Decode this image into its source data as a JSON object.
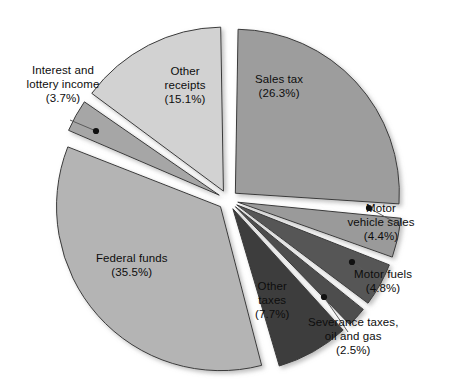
{
  "chart_data": {
    "type": "pie",
    "title": "",
    "subtitle": "",
    "xlabel": "",
    "ylabel": "",
    "legend_position": "none",
    "grid": false,
    "exploded": true,
    "value_unit": "percent",
    "categories": [
      "Sales tax",
      "Motor vehicle sales",
      "Motor fuels",
      "Severance taxes, oil and gas",
      "Other taxes",
      "Federal funds",
      "Interest and lottery income",
      "Other receipts"
    ],
    "values": [
      26.3,
      4.4,
      4.8,
      2.5,
      7.7,
      35.5,
      3.7,
      15.1
    ],
    "slices": [
      {
        "name": "sales-tax",
        "label": "Sales tax",
        "value": 26.3,
        "value_text": "(26.3%)",
        "color": "#9d9d9d",
        "label_placement": "inside",
        "label_x": 279,
        "label_y": 86,
        "label_text": "Sales tax\n(26.3%)"
      },
      {
        "name": "motor-vehicle-sales",
        "label": "Motor vehicle sales",
        "value": 4.4,
        "value_text": "(4.4%)",
        "color": "#9a9a9a",
        "label_placement": "outside",
        "label_x": 381,
        "label_y": 222,
        "label_text": "Motor\nvehicle sales\n(4.4%)",
        "dot_x": 369,
        "dot_y": 208,
        "leader_x": 398,
        "leader_y": 224
      },
      {
        "name": "motor-fuels",
        "label": "Motor fuels",
        "value": 4.8,
        "value_text": "(4.8%)",
        "color": "#575757",
        "label_placement": "outside",
        "label_x": 383,
        "label_y": 281,
        "label_text": "Motor fuels\n(4.8%)",
        "dot_x": 352,
        "dot_y": 262,
        "leader_x": 382,
        "leader_y": 283
      },
      {
        "name": "severance-taxes-oil-and-gas",
        "label": "Severance taxes, oil and gas",
        "value": 2.5,
        "value_text": "(2.5%)",
        "color": "#4e4e4e",
        "label_placement": "outside",
        "label_x": 353,
        "label_y": 336,
        "label_text": "Severance taxes,\noil and gas\n(2.5%)",
        "dot_x": 324,
        "dot_y": 297,
        "leader_x": 348,
        "leader_y": 332
      },
      {
        "name": "other-taxes",
        "label": "Other taxes",
        "value": 7.7,
        "value_text": "(7.7%)",
        "color": "#3c3c3c",
        "label_placement": "inside",
        "label_x": 272,
        "label_y": 300,
        "label_text": "Other\ntaxes\n(7.7%)"
      },
      {
        "name": "federal-funds",
        "label": "Federal funds",
        "value": 35.5,
        "value_text": "(35.5%)",
        "color": "#b4b4b4",
        "label_placement": "inside",
        "label_x": 132,
        "label_y": 265,
        "label_text": "Federal funds\n(35.5%)"
      },
      {
        "name": "interest-and-lottery-income",
        "label": "Interest and lottery income",
        "value": 3.7,
        "value_text": "(3.7%)",
        "color": "#a6a6a6",
        "label_placement": "outside",
        "label_x": 63,
        "label_y": 84,
        "label_text": "Interest and\nlottery income\n(3.7%)",
        "dot_x": 96,
        "dot_y": 131,
        "leader_x": 70,
        "leader_y": 120
      },
      {
        "name": "other-receipts",
        "label": "Other receipts",
        "value": 15.1,
        "value_text": "(15.1%)",
        "color": "#d2d2d2",
        "label_placement": "inside",
        "label_x": 185,
        "label_y": 85,
        "label_text": "Other\nreceipts\n(15.1%)"
      }
    ]
  },
  "geometry": {
    "center_x": 228,
    "center_y": 200,
    "radius": 164,
    "explode": 10,
    "start_angle_deg": -90
  },
  "colors": {
    "background": "#ffffff",
    "outline": "#3a3a3a",
    "text": "#0d0d0d",
    "leader": "#5a5a5a"
  }
}
